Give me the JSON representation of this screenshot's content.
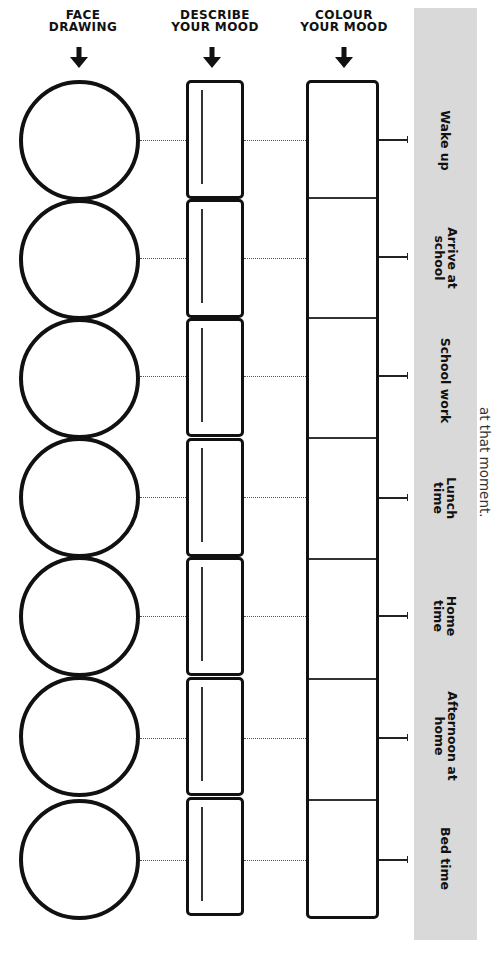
{
  "headers": {
    "face": {
      "line1": "FACE",
      "line2": "DRAWING"
    },
    "describe": {
      "line1": "DESCRIBE",
      "line2": "YOUR MOOD"
    },
    "colour": {
      "line1": "COLOUR",
      "line2": "YOUR MOOD"
    }
  },
  "arrow_icon": "down-arrow",
  "times": [
    {
      "line1": "Wake up",
      "line2": ""
    },
    {
      "line1": "Arrive at",
      "line2": "school"
    },
    {
      "line1": "School work",
      "line2": ""
    },
    {
      "line1": "Lunch",
      "line2": "time"
    },
    {
      "line1": "Home",
      "line2": "time"
    },
    {
      "line1": "Afternoon at",
      "line2": "home"
    },
    {
      "line1": "Bed time",
      "line2": ""
    }
  ],
  "side_note": "at that moment.",
  "colors": {
    "band": "#d9d9d9",
    "ink": "#111111"
  }
}
